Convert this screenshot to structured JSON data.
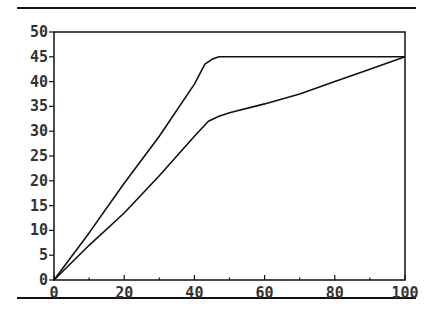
{
  "chart_data": {
    "type": "line",
    "title": "",
    "xlabel": "",
    "ylabel": "",
    "xlim": [
      0,
      100
    ],
    "ylim": [
      0,
      50
    ],
    "grid": false,
    "legend": null,
    "x_ticks": [
      0,
      20,
      40,
      60,
      80,
      100
    ],
    "x_minor_ticks": [
      10,
      30,
      50,
      70,
      90
    ],
    "y_ticks": [
      0,
      5,
      10,
      15,
      20,
      25,
      30,
      35,
      40,
      45,
      50
    ],
    "series": [
      {
        "name": "upper",
        "color": "#111111",
        "points": [
          [
            0,
            0
          ],
          [
            10,
            9.5
          ],
          [
            20,
            19.5
          ],
          [
            30,
            29
          ],
          [
            40,
            39.5
          ],
          [
            43,
            43.5
          ],
          [
            45,
            44.5
          ],
          [
            47,
            45
          ],
          [
            60,
            45
          ],
          [
            80,
            45
          ],
          [
            100,
            45
          ]
        ]
      },
      {
        "name": "lower",
        "color": "#111111",
        "points": [
          [
            0,
            0
          ],
          [
            10,
            7
          ],
          [
            20,
            13.5
          ],
          [
            30,
            21
          ],
          [
            40,
            29
          ],
          [
            44,
            32
          ],
          [
            47,
            33
          ],
          [
            50,
            33.7
          ],
          [
            60,
            35.5
          ],
          [
            70,
            37.5
          ],
          [
            80,
            40
          ],
          [
            90,
            42.5
          ],
          [
            100,
            45
          ]
        ]
      }
    ]
  },
  "layout": {
    "plot": {
      "left": 54,
      "right": 405,
      "top": 32,
      "bottom": 280
    },
    "rules": {
      "top_y": 7,
      "bottom_y": 297,
      "left": 17,
      "right": 416
    },
    "colors": {
      "ink": "#111111",
      "label": "#333333",
      "background": "#ffffff"
    }
  }
}
